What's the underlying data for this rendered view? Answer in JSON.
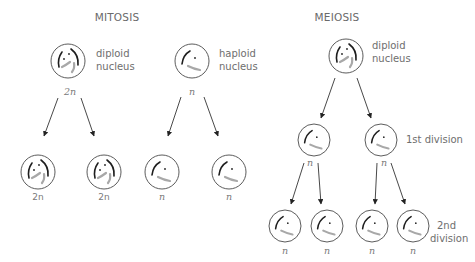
{
  "diagram": {
    "sections": [
      {
        "id": "mitosis",
        "title": "MITOSIS"
      },
      {
        "id": "meiosis",
        "title": "MEIOSIS"
      }
    ],
    "labels": {
      "mitosis_diploid": [
        "diploid",
        "nucleus"
      ],
      "mitosis_haploid": [
        "haploid",
        "nucleus"
      ],
      "meiosis_diploid": [
        "diploid",
        "nucleus"
      ],
      "first_division": "1st division",
      "second_division": [
        "2nd",
        "division"
      ]
    },
    "ploidy": {
      "diploid": "2n",
      "haploid": "n"
    },
    "nodes": [
      {
        "id": "mit-d-parent",
        "type": "diploid",
        "cx": 68,
        "cy": 61,
        "r": 17,
        "ploidy_label": "2n"
      },
      {
        "id": "mit-d-child-1",
        "type": "diploid",
        "cx": 38,
        "cy": 172,
        "r": 17,
        "ploidy_label": "2n"
      },
      {
        "id": "mit-d-child-2",
        "type": "diploid",
        "cx": 104,
        "cy": 172,
        "r": 17,
        "ploidy_label": "2n"
      },
      {
        "id": "mit-h-parent",
        "type": "haploid",
        "cx": 192,
        "cy": 61,
        "r": 17,
        "ploidy_label": "n"
      },
      {
        "id": "mit-h-child-1",
        "type": "haploid",
        "cx": 162,
        "cy": 172,
        "r": 17,
        "ploidy_label": "n"
      },
      {
        "id": "mit-h-child-2",
        "type": "haploid",
        "cx": 229,
        "cy": 172,
        "r": 17,
        "ploidy_label": "n"
      },
      {
        "id": "mei-parent",
        "type": "diploid",
        "cx": 346,
        "cy": 56,
        "r": 17,
        "ploidy_label": ""
      },
      {
        "id": "mei-1-a",
        "type": "haploid",
        "cx": 314,
        "cy": 140,
        "r": 16,
        "ploidy_label": "n"
      },
      {
        "id": "mei-1-b",
        "type": "haploid",
        "cx": 381,
        "cy": 140,
        "r": 16,
        "ploidy_label": "n"
      },
      {
        "id": "mei-2-a",
        "type": "haploid",
        "cx": 285,
        "cy": 226,
        "r": 16,
        "ploidy_label": "n"
      },
      {
        "id": "mei-2-b",
        "type": "haploid",
        "cx": 327,
        "cy": 226,
        "r": 16,
        "ploidy_label": "n"
      },
      {
        "id": "mei-2-c",
        "type": "haploid",
        "cx": 372,
        "cy": 226,
        "r": 16,
        "ploidy_label": "n"
      },
      {
        "id": "mei-2-d",
        "type": "haploid",
        "cx": 413,
        "cy": 226,
        "r": 16,
        "ploidy_label": "n"
      }
    ],
    "edges": [
      {
        "from": "mit-d-parent",
        "to": "mit-d-child-1"
      },
      {
        "from": "mit-d-parent",
        "to": "mit-d-child-2"
      },
      {
        "from": "mit-h-parent",
        "to": "mit-h-child-1"
      },
      {
        "from": "mit-h-parent",
        "to": "mit-h-child-2"
      },
      {
        "from": "mei-parent",
        "to": "mei-1-a"
      },
      {
        "from": "mei-parent",
        "to": "mei-1-b"
      },
      {
        "from": "mei-1-a",
        "to": "mei-2-a"
      },
      {
        "from": "mei-1-a",
        "to": "mei-2-b"
      },
      {
        "from": "mei-1-b",
        "to": "mei-2-c"
      },
      {
        "from": "mei-1-b",
        "to": "mei-2-d"
      }
    ],
    "colors": {
      "ring": "#4a4a4a",
      "chromosome_dark": "#1e1e1e",
      "chromosome_light": "#a8a8a8",
      "text": "#6e6e6e",
      "arrow": "#333333"
    }
  }
}
